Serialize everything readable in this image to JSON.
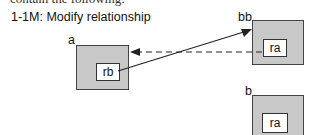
{
  "cut_text": "contain the following:",
  "title": "1-1M: Modify relationship",
  "objects": [
    {
      "label": "a",
      "inner": "rb"
    },
    {
      "label": "bb",
      "inner": "ra"
    },
    {
      "label": "b",
      "inner": "ra"
    }
  ],
  "edges": [
    {
      "from": "a.rb",
      "to": "bb",
      "style": "solid"
    },
    {
      "from": "bb.ra",
      "to": "a",
      "style": "dashed"
    }
  ]
}
